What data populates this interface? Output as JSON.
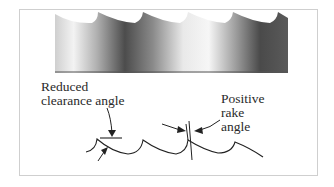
{
  "figure": {
    "labels": {
      "clearance": [
        "Reduced",
        "clearance angle"
      ],
      "rake": [
        "Positive",
        "rake",
        "angle"
      ]
    }
  },
  "colors": {
    "frame": "#cfcfcf",
    "line": "#222222",
    "blade_light": "#f4f4f4",
    "blade_dark": "#4a4a4a"
  }
}
